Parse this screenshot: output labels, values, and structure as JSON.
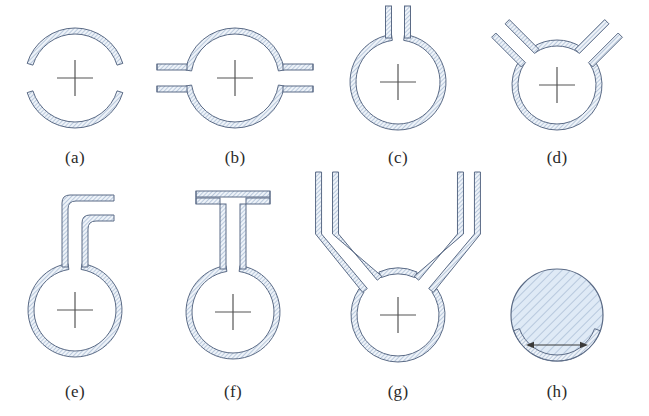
{
  "figure": {
    "width": 649,
    "height": 416,
    "background": "#ffffff",
    "style": {
      "outline_color": "#5b6b86",
      "hatch_color": "#8fa6c4",
      "wall_fill": "#eef3f9",
      "disk_fill": "#dfeaf6",
      "crosshair_color": "#555555",
      "label_color": "#2b2b2b",
      "wall_thickness_px": 6,
      "hatch_spacing_px": 3
    },
    "rows": 2,
    "columns": 4,
    "panels": [
      {
        "id": "a",
        "label": "(a)",
        "shape": "split-ring-two-gaps",
        "description": "Circular annulus interrupted by two gaps on the left and right at the horizontal midline",
        "has_crosshair": true,
        "hatched_solid": false,
        "center": {
          "x": 75,
          "y": 78
        },
        "outer_radius": 50,
        "label_y": 148
      },
      {
        "id": "b",
        "label": "(b)",
        "shape": "ring-with-two-horizontal-stubs",
        "description": "Annulus with straight rectangular channels projecting horizontally left and right from the two gaps",
        "has_crosshair": true,
        "hatched_solid": false,
        "center": {
          "x": 235,
          "y": 78
        },
        "outer_radius": 50,
        "stub_length": 30,
        "stub_width": 16,
        "label_y": 148
      },
      {
        "id": "c",
        "label": "(c)",
        "shape": "ring-with-single-vertical-stem",
        "description": "Closed annulus with one narrow vertical stem rising from the top",
        "has_crosshair": true,
        "hatched_solid": false,
        "center": {
          "x": 398,
          "y": 82
        },
        "outer_radius": 48,
        "stem_height": 28,
        "stem_width": 13,
        "label_y": 148
      },
      {
        "id": "d",
        "label": "(d)",
        "shape": "ring-with-two-angled-arms",
        "description": "Annulus with two short arms angled diagonally outward and upward in a V arrangement",
        "has_crosshair": true,
        "hatched_solid": false,
        "center": {
          "x": 557,
          "y": 85
        },
        "outer_radius": 45,
        "arm_length": 42,
        "arm_width": 13,
        "arm_angle_deg": 45,
        "label_y": 148
      },
      {
        "id": "e",
        "label": "(e)",
        "shape": "ring-with-L-bend-stem",
        "description": "Annulus with a tall vertical stem that bends ninety degrees to the right at its top",
        "has_crosshair": true,
        "hatched_solid": false,
        "center": {
          "x": 75,
          "y": 310
        },
        "outer_radius": 47,
        "stem_height": 72,
        "stem_width": 14,
        "bend_length": 32,
        "label_y": 382
      },
      {
        "id": "f",
        "label": "(f)",
        "shape": "ring-with-T-stem",
        "description": "Annulus with a vertical stem topped by a horizontal crossbar forming a T",
        "has_crosshair": true,
        "hatched_solid": false,
        "center": {
          "x": 233,
          "y": 312
        },
        "outer_radius": 47,
        "stem_height": 78,
        "stem_width": 14,
        "crossbar_width": 74,
        "crossbar_height": 13,
        "label_y": 382
      },
      {
        "id": "g",
        "label": "(g)",
        "shape": "ring-with-flared-vertical-arms",
        "description": "Annulus with two arms that splay outward diagonally then run straight up vertically",
        "has_crosshair": true,
        "hatched_solid": false,
        "center": {
          "x": 398,
          "y": 315
        },
        "outer_radius": 47,
        "arm_width": 13,
        "arm_height": 96,
        "label_y": 382
      },
      {
        "id": "h",
        "label": "(h)",
        "shape": "solid-hatched-disk-with-dimension-arrow",
        "description": "Fully hatched solid disk with a horizontal double-headed dimension arrow spanning a chord near the bottom",
        "has_crosshair": false,
        "hatched_solid": true,
        "center": {
          "x": 557,
          "y": 315
        },
        "outer_radius": 46,
        "arrow": {
          "type": "double-headed",
          "orientation": "horizontal",
          "x_start": 526,
          "x_end": 588,
          "y": 345
        },
        "label_y": 382
      }
    ]
  }
}
